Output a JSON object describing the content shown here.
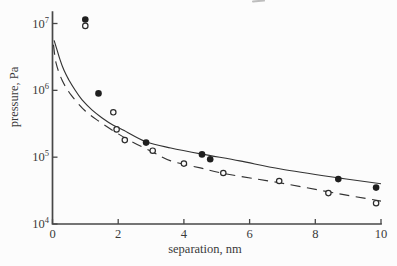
{
  "figure": {
    "background": "#fcfcfc",
    "axis_color": "#474747",
    "text_color": "#3a3a3a",
    "curve_color": "#333333",
    "marker_color": "#1f1f1f"
  },
  "chart_data": {
    "type": "scatter",
    "title": "",
    "xlabel": "separation, nm",
    "ylabel": "pressure, Pa",
    "grid": false,
    "legend": "none",
    "x_axis": {
      "min": 0,
      "max": 10,
      "scale": "linear",
      "ticks": [
        0,
        2,
        4,
        6,
        8,
        10
      ]
    },
    "y_axis": {
      "min": 10000.0,
      "max": 10000000.0,
      "scale": "log",
      "tick_base": "10",
      "tick_exponents": [
        4,
        5,
        6,
        7
      ]
    },
    "series": [
      {
        "name": "filled-circle-data",
        "type": "scatter",
        "marker": "filled-circle",
        "points": [
          [
            1.0,
            11500000.0
          ],
          [
            1.4,
            900000.0
          ],
          [
            2.85,
            165000.0
          ],
          [
            4.55,
            110000.0
          ],
          [
            4.8,
            93000.0
          ],
          [
            8.7,
            47000.0
          ],
          [
            9.85,
            35000.0
          ]
        ]
      },
      {
        "name": "open-circle-data",
        "type": "scatter",
        "marker": "open-circle",
        "points": [
          [
            1.0,
            9200000.0
          ],
          [
            1.85,
            470000.0
          ],
          [
            1.95,
            260000.0
          ],
          [
            2.2,
            180000.0
          ],
          [
            3.05,
            125000.0
          ],
          [
            4.0,
            80000.0
          ],
          [
            5.2,
            58000.0
          ],
          [
            6.9,
            44000.0
          ],
          [
            8.4,
            29000.0
          ],
          [
            9.85,
            20500.0
          ]
        ]
      },
      {
        "name": "solid-theory-curve",
        "type": "line",
        "style": "solid",
        "points": [
          [
            0.05,
            5600000.0
          ],
          [
            0.14,
            4000000.0
          ],
          [
            0.23,
            2850000.0
          ],
          [
            0.35,
            2000000.0
          ],
          [
            0.5,
            1430000.0
          ],
          [
            0.69,
            1000000.0
          ],
          [
            0.9,
            720000.0
          ],
          [
            1.2,
            510000.0
          ],
          [
            1.5,
            390000.0
          ],
          [
            1.85,
            300000.0
          ],
          [
            2.15,
            255000.0
          ],
          [
            2.85,
            170000.0
          ],
          [
            3.6,
            137000.0
          ],
          [
            4.55,
            111000.0
          ],
          [
            5.7,
            88000.0
          ],
          [
            6.95,
            66500.0
          ],
          [
            8.7,
            49000.0
          ],
          [
            10,
            40000.0
          ]
        ]
      },
      {
        "name": "dashed-theory-curve",
        "type": "line",
        "style": "dashed",
        "points": [
          [
            0.03,
            4800000.0
          ],
          [
            0.11,
            2560000.0
          ],
          [
            0.29,
            1430000.0
          ],
          [
            0.57,
            850000.0
          ],
          [
            1.0,
            490000.0
          ],
          [
            1.45,
            335000.0
          ],
          [
            1.9,
            240000.0
          ],
          [
            2.37,
            175000.0
          ],
          [
            3.04,
            120000.0
          ],
          [
            3.6,
            88000.0
          ],
          [
            4.5,
            69000.0
          ],
          [
            5.3,
            56000.0
          ],
          [
            6.95,
            41000.0
          ],
          [
            8.78,
            28000.0
          ],
          [
            10,
            22000.0
          ]
        ]
      }
    ]
  }
}
